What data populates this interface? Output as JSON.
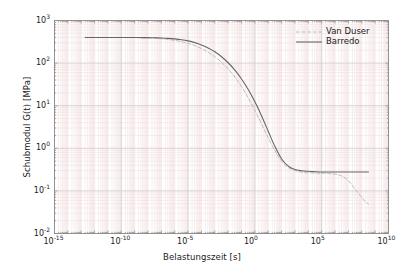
{
  "chart_data": {
    "type": "line",
    "title": "",
    "xlabel": "Belastungszeit [s]",
    "ylabel": "Schubmodul G(t) [MPa]",
    "xscale": "log",
    "yscale": "log",
    "xlim": [
      1e-15,
      10000000000.0
    ],
    "ylim": [
      0.01,
      1000
    ],
    "grid": true,
    "grid_minor": true,
    "legend_position": "top-right",
    "xticks": [
      {
        "value": 1e-15,
        "mantissa": "10",
        "exponent": "-15"
      },
      {
        "value": 1e-10,
        "mantissa": "10",
        "exponent": "-10"
      },
      {
        "value": 1e-05,
        "mantissa": "10",
        "exponent": "-5"
      },
      {
        "value": 1.0,
        "mantissa": "10",
        "exponent": "0"
      },
      {
        "value": 100000.0,
        "mantissa": "10",
        "exponent": "5"
      },
      {
        "value": 10000000000.0,
        "mantissa": "10",
        "exponent": "10"
      }
    ],
    "yticks": [
      {
        "value": 1000,
        "mantissa": "10",
        "exponent": "3"
      },
      {
        "value": 100,
        "mantissa": "10",
        "exponent": "2"
      },
      {
        "value": 10,
        "mantissa": "10",
        "exponent": "1"
      },
      {
        "value": 1,
        "mantissa": "10",
        "exponent": "0"
      },
      {
        "value": 0.1,
        "mantissa": "10",
        "exponent": "-1"
      },
      {
        "value": 0.01,
        "mantissa": "10",
        "exponent": "-2"
      }
    ],
    "series": [
      {
        "name": "Van Duser",
        "style": "dashed",
        "color": "#b4b4b4",
        "points": [
          [
            -12.7,
            2.602
          ],
          [
            -12.0,
            2.602
          ],
          [
            -11.0,
            2.601
          ],
          [
            -10.0,
            2.6
          ],
          [
            -9.0,
            2.598
          ],
          [
            -8.5,
            2.595
          ],
          [
            -8.0,
            2.59
          ],
          [
            -7.5,
            2.583
          ],
          [
            -7.0,
            2.572
          ],
          [
            -6.5,
            2.556
          ],
          [
            -6.0,
            2.533
          ],
          [
            -5.5,
            2.502
          ],
          [
            -5.0,
            2.462
          ],
          [
            -4.5,
            2.409
          ],
          [
            -4.0,
            2.341
          ],
          [
            -3.5,
            2.256
          ],
          [
            -3.0,
            2.15
          ],
          [
            -2.5,
            2.02
          ],
          [
            -2.0,
            1.862
          ],
          [
            -1.5,
            1.672
          ],
          [
            -1.0,
            1.447
          ],
          [
            -0.5,
            1.185
          ],
          [
            0.0,
            0.89
          ],
          [
            0.5,
            0.57
          ],
          [
            1.0,
            0.245
          ],
          [
            1.5,
            -0.06
          ],
          [
            2.0,
            -0.3
          ],
          [
            2.5,
            -0.452
          ],
          [
            3.0,
            -0.527
          ],
          [
            3.5,
            -0.56
          ],
          [
            4.0,
            -0.574
          ],
          [
            4.5,
            -0.58
          ],
          [
            5.0,
            -0.585
          ],
          [
            5.5,
            -0.592
          ],
          [
            6.0,
            -0.607
          ],
          [
            6.5,
            -0.65
          ],
          [
            7.0,
            -0.76
          ],
          [
            7.5,
            -0.96
          ],
          [
            8.0,
            -1.15
          ],
          [
            8.3,
            -1.265
          ],
          [
            8.5,
            -1.305
          ]
        ]
      },
      {
        "name": "Barredo",
        "style": "solid",
        "color": "#666666",
        "points": [
          [
            -12.7,
            2.602
          ],
          [
            -12.0,
            2.602
          ],
          [
            -11.0,
            2.602
          ],
          [
            -10.0,
            2.601
          ],
          [
            -9.0,
            2.6
          ],
          [
            -8.5,
            2.599
          ],
          [
            -8.0,
            2.597
          ],
          [
            -7.5,
            2.594
          ],
          [
            -7.0,
            2.589
          ],
          [
            -6.5,
            2.581
          ],
          [
            -6.0,
            2.568
          ],
          [
            -5.5,
            2.549
          ],
          [
            -5.0,
            2.521
          ],
          [
            -4.5,
            2.481
          ],
          [
            -4.0,
            2.427
          ],
          [
            -3.5,
            2.356
          ],
          [
            -3.0,
            2.265
          ],
          [
            -2.5,
            2.15
          ],
          [
            -2.0,
            2.008
          ],
          [
            -1.5,
            1.836
          ],
          [
            -1.0,
            1.628
          ],
          [
            -0.5,
            1.38
          ],
          [
            0.0,
            1.09
          ],
          [
            0.5,
            0.76
          ],
          [
            1.0,
            0.4
          ],
          [
            1.5,
            0.04
          ],
          [
            2.0,
            -0.25
          ],
          [
            2.5,
            -0.42
          ],
          [
            3.0,
            -0.5
          ],
          [
            3.5,
            -0.527
          ],
          [
            4.0,
            -0.54
          ],
          [
            4.5,
            -0.549
          ],
          [
            5.0,
            -0.556
          ],
          [
            5.5,
            -0.556
          ],
          [
            6.0,
            -0.556
          ],
          [
            6.5,
            -0.556
          ],
          [
            7.0,
            -0.556
          ],
          [
            7.5,
            -0.556
          ],
          [
            8.0,
            -0.556
          ],
          [
            8.5,
            -0.556
          ]
        ]
      }
    ],
    "annotations": []
  },
  "legend": {
    "items": [
      {
        "label": "Van Duser"
      },
      {
        "label": "Barredo"
      }
    ]
  },
  "colors": {
    "background": "#ffffff",
    "frame": "#8c8c8c",
    "grid_major": "#c8c8c8",
    "grid_minor": "#f0dcdc",
    "text": "#1a1a1a",
    "series_van_duser": "#b4b4b4",
    "series_barredo": "#666666"
  }
}
